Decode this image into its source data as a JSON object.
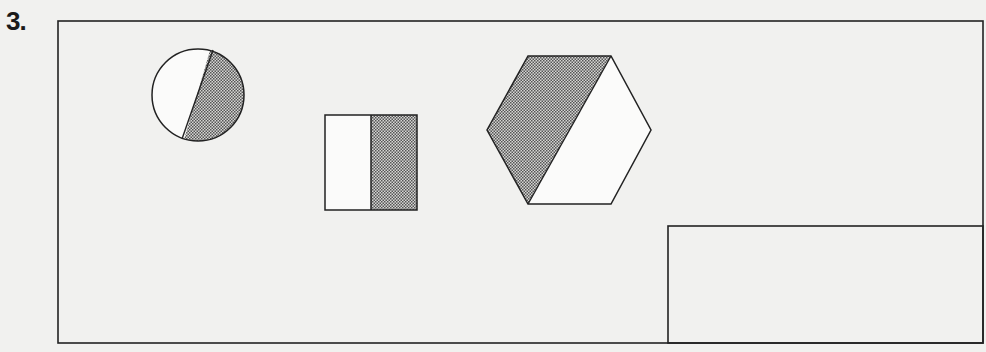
{
  "question": {
    "number_label": "3."
  },
  "colors": {
    "stroke": "#222222",
    "shade": "#9a9a9a",
    "paper": "#f1f1ef"
  },
  "figures": [
    {
      "shape": "circle",
      "fraction_shaded": "1/2",
      "shaded_part": "right"
    },
    {
      "shape": "rectangle",
      "fraction_shaded": "1/2",
      "shaded_part": "right"
    },
    {
      "shape": "hexagon",
      "fraction_shaded": "1/2",
      "shaded_part": "left"
    }
  ],
  "answer_box": {
    "label": ""
  }
}
